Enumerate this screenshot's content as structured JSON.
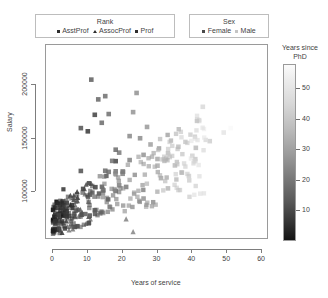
{
  "legends": {
    "rank": {
      "title": "Rank",
      "items": [
        {
          "label": "AsstProf",
          "marker": "square-dark",
          "color": "#2e2e2e"
        },
        {
          "label": "AssocProf",
          "marker": "triangle-dark",
          "color": "#2e2e2e"
        },
        {
          "label": "Prof",
          "marker": "square-dark",
          "color": "#2e2e2e"
        }
      ]
    },
    "sex": {
      "title": "Sex",
      "items": [
        {
          "label": "Female",
          "marker": "square-dark",
          "color": "#4a4a4a"
        },
        {
          "label": "Male",
          "marker": "square-light",
          "color": "#c4c4c4"
        }
      ]
    },
    "colorbar": {
      "title_line1": "Years since",
      "title_line2": "PhD",
      "ticks": [
        10,
        20,
        30,
        40,
        50
      ],
      "low_color": "#111111",
      "high_color": "#fbfbfb"
    }
  },
  "chart_data": {
    "type": "scatter",
    "title": "",
    "xlabel": "Years of service",
    "ylabel": "Salary",
    "xlim": [
      -2,
      62
    ],
    "ylim": [
      55000,
      238000
    ],
    "xticks": [
      0,
      10,
      20,
      30,
      40,
      50,
      60
    ],
    "yticks": [
      100000,
      150000,
      200000
    ],
    "grid": false,
    "encodings": {
      "shape": "Rank",
      "fill": "Sex",
      "color": "Years since PhD"
    },
    "points": [
      {
        "x": 18,
        "y": 139750,
        "rank": "Prof",
        "sex": "Male",
        "phd": 19
      },
      {
        "x": 16,
        "y": 173200,
        "rank": "Prof",
        "sex": "Male",
        "phd": 20
      },
      {
        "x": 3,
        "y": 79750,
        "rank": "AsstProf",
        "sex": "Male",
        "phd": 4
      },
      {
        "x": 39,
        "y": 115000,
        "rank": "Prof",
        "sex": "Male",
        "phd": 45
      },
      {
        "x": 41,
        "y": 141500,
        "rank": "Prof",
        "sex": "Male",
        "phd": 40
      },
      {
        "x": 6,
        "y": 97000,
        "rank": "AssocProf",
        "sex": "Male",
        "phd": 6
      },
      {
        "x": 23,
        "y": 175000,
        "rank": "Prof",
        "sex": "Male",
        "phd": 30
      },
      {
        "x": 45,
        "y": 147765,
        "rank": "Prof",
        "sex": "Male",
        "phd": 45
      },
      {
        "x": 20,
        "y": 119250,
        "rank": "Prof",
        "sex": "Male",
        "phd": 21
      },
      {
        "x": 18,
        "y": 129000,
        "rank": "Prof",
        "sex": "Female",
        "phd": 18
      },
      {
        "x": 8,
        "y": 119800,
        "rank": "Prof",
        "sex": "Male",
        "phd": 12
      },
      {
        "x": 4,
        "y": 79800,
        "rank": "AsstProf",
        "sex": "Male",
        "phd": 5
      },
      {
        "x": 3,
        "y": 77700,
        "rank": "AsstProf",
        "sex": "Male",
        "phd": 4
      },
      {
        "x": 3,
        "y": 78000,
        "rank": "AsstProf",
        "sex": "Male",
        "phd": 4
      },
      {
        "x": 21,
        "y": 104800,
        "rank": "Prof",
        "sex": "Male",
        "phd": 23
      },
      {
        "x": 20,
        "y": 117150,
        "rank": "Prof",
        "sex": "Male",
        "phd": 25
      },
      {
        "x": 18,
        "y": 101000,
        "rank": "Prof",
        "sex": "Male",
        "phd": 20
      },
      {
        "x": 33,
        "y": 103450,
        "rank": "Prof",
        "sex": "Male",
        "phd": 39
      },
      {
        "x": 30,
        "y": 124750,
        "rank": "Prof",
        "sex": "Male",
        "phd": 36
      },
      {
        "x": 19,
        "y": 137000,
        "rank": "Prof",
        "sex": "Male",
        "phd": 23
      },
      {
        "x": 3,
        "y": 89565,
        "rank": "AsstProf",
        "sex": "Male",
        "phd": 5
      },
      {
        "x": 3,
        "y": 102580,
        "rank": "AsstProf",
        "sex": "Male",
        "phd": 4
      },
      {
        "x": 26,
        "y": 93904,
        "rank": "Prof",
        "sex": "Male",
        "phd": 30
      },
      {
        "x": 31,
        "y": 113068,
        "rank": "Prof",
        "sex": "Male",
        "phd": 35
      },
      {
        "x": 21,
        "y": 74830,
        "rank": "AssocProf",
        "sex": "Male",
        "phd": 25
      },
      {
        "x": 19,
        "y": 106294,
        "rank": "Prof",
        "sex": "Male",
        "phd": 24
      },
      {
        "x": 26,
        "y": 134885,
        "rank": "Prof",
        "sex": "Male",
        "phd": 30
      },
      {
        "x": 4,
        "y": 82379,
        "rank": "AsstProf",
        "sex": "Male",
        "phd": 6
      },
      {
        "x": 4,
        "y": 77000,
        "rank": "AsstProf",
        "sex": "Male",
        "phd": 5
      },
      {
        "x": 37,
        "y": 118223,
        "rank": "Prof",
        "sex": "Male",
        "phd": 42
      },
      {
        "x": 5,
        "y": 97000,
        "rank": "AssocProf",
        "sex": "Male",
        "phd": 8
      },
      {
        "x": 4,
        "y": 89942,
        "rank": "AsstProf",
        "sex": "Male",
        "phd": 6
      },
      {
        "x": 27,
        "y": 161101,
        "rank": "Prof",
        "sex": "Male",
        "phd": 31
      },
      {
        "x": 18,
        "y": 119450,
        "rank": "Prof",
        "sex": "Male",
        "phd": 22
      },
      {
        "x": 17,
        "y": 129250,
        "rank": "Prof",
        "sex": "Male",
        "phd": 21
      },
      {
        "x": 3,
        "y": 82100,
        "rank": "AsstProf",
        "sex": "Male",
        "phd": 4
      },
      {
        "x": 22,
        "y": 130000,
        "rank": "Prof",
        "sex": "Male",
        "phd": 25
      },
      {
        "x": 28,
        "y": 144651,
        "rank": "Prof",
        "sex": "Male",
        "phd": 33
      },
      {
        "x": 16,
        "y": 118971,
        "rank": "Prof",
        "sex": "Male",
        "phd": 20
      },
      {
        "x": 15,
        "y": 120000,
        "rank": "Prof",
        "sex": "Male",
        "phd": 19
      },
      {
        "x": 6,
        "y": 93000,
        "rank": "AssocProf",
        "sex": "Male",
        "phd": 9
      },
      {
        "x": 9,
        "y": 103106,
        "rank": "AssocProf",
        "sex": "Male",
        "phd": 12
      },
      {
        "x": 7,
        "y": 92000,
        "rank": "AssocProf",
        "sex": "Male",
        "phd": 10
      },
      {
        "x": 2,
        "y": 85000,
        "rank": "AsstProf",
        "sex": "Male",
        "phd": 3
      },
      {
        "x": 2,
        "y": 80000,
        "rank": "AsstProf",
        "sex": "Male",
        "phd": 3
      },
      {
        "x": 1,
        "y": 91000,
        "rank": "AsstProf",
        "sex": "Female",
        "phd": 2
      },
      {
        "x": 1,
        "y": 73000,
        "rank": "AsstProf",
        "sex": "Female",
        "phd": 2
      },
      {
        "x": 0,
        "y": 74000,
        "rank": "AsstProf",
        "sex": "Female",
        "phd": 1
      },
      {
        "x": 0,
        "y": 72500,
        "rank": "AsstProf",
        "sex": "Male",
        "phd": 1
      },
      {
        "x": 2,
        "y": 76500,
        "rank": "AsstProf",
        "sex": "Male",
        "phd": 3
      },
      {
        "x": 25,
        "y": 150480,
        "rank": "Prof",
        "sex": "Male",
        "phd": 28
      },
      {
        "x": 36,
        "y": 142500,
        "rank": "Prof",
        "sex": "Male",
        "phd": 41
      },
      {
        "x": 49,
        "y": 155865,
        "rank": "Prof",
        "sex": "Male",
        "phd": 51
      },
      {
        "x": 51,
        "y": 160000,
        "rank": "Prof",
        "sex": "Male",
        "phd": 56
      },
      {
        "x": 43,
        "y": 180000,
        "rank": "Prof",
        "sex": "Male",
        "phd": 48
      },
      {
        "x": 13,
        "y": 186960,
        "rank": "Prof",
        "sex": "Male",
        "phd": 18
      },
      {
        "x": 24,
        "y": 193000,
        "rank": "Prof",
        "sex": "Male",
        "phd": 29
      },
      {
        "x": 11,
        "y": 205500,
        "rank": "Prof",
        "sex": "Male",
        "phd": 16
      },
      {
        "x": 15,
        "y": 190000,
        "rank": "Prof",
        "sex": "Male",
        "phd": 20
      },
      {
        "x": 8,
        "y": 160000,
        "rank": "Prof",
        "sex": "Male",
        "phd": 13
      },
      {
        "x": 14,
        "y": 165000,
        "rank": "Prof",
        "sex": "Male",
        "phd": 19
      },
      {
        "x": 22,
        "y": 152500,
        "rank": "Prof",
        "sex": "Male",
        "phd": 27
      },
      {
        "x": 12,
        "y": 172500,
        "rank": "Prof",
        "sex": "Female",
        "phd": 17
      },
      {
        "x": 10,
        "y": 157000,
        "rank": "Prof",
        "sex": "Female",
        "phd": 15
      },
      {
        "x": 30,
        "y": 131000,
        "rank": "Prof",
        "sex": "Male",
        "phd": 35
      },
      {
        "x": 35,
        "y": 125000,
        "rank": "Prof",
        "sex": "Male",
        "phd": 40
      },
      {
        "x": 40,
        "y": 134000,
        "rank": "Prof",
        "sex": "Male",
        "phd": 46
      },
      {
        "x": 5,
        "y": 88000,
        "rank": "AssocProf",
        "sex": "Female",
        "phd": 8
      },
      {
        "x": 7,
        "y": 95000,
        "rank": "AssocProf",
        "sex": "Female",
        "phd": 11
      },
      {
        "x": 11,
        "y": 108000,
        "rank": "AssocProf",
        "sex": "Male",
        "phd": 14
      },
      {
        "x": 23,
        "y": 62884,
        "rank": "AssocProf",
        "sex": "Male",
        "phd": 26
      }
    ]
  }
}
